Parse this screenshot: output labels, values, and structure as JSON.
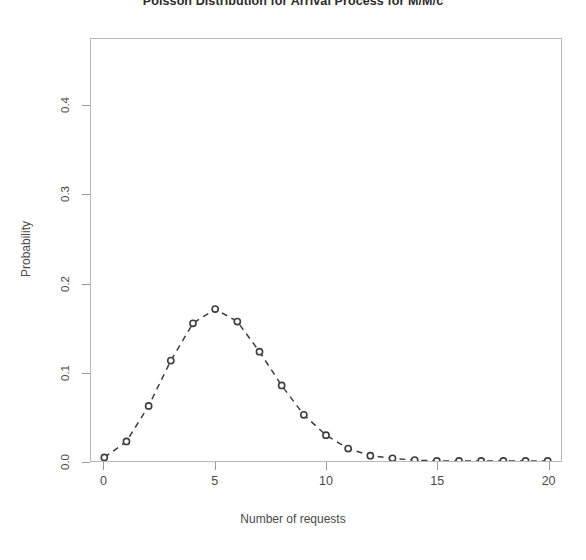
{
  "chart_data": {
    "type": "line",
    "title": "Poisson Distribution for Arrival Process for M/M/c",
    "subtitle": "",
    "xlabel": "Number of requests",
    "ylabel": "Probability",
    "xlim": [
      -0.6,
      20.6
    ],
    "ylim": [
      0.0,
      0.475
    ],
    "grid": false,
    "legend": false,
    "marker": "open-circle",
    "linestyle": "dashed",
    "color": "#3c3c3c",
    "xticks": [
      0,
      5,
      10,
      15,
      20
    ],
    "xtick_labels": [
      "0",
      "5",
      "10",
      "15",
      "20"
    ],
    "yticks": [
      0.0,
      0.1,
      0.2,
      0.3,
      0.4
    ],
    "ytick_labels": [
      "0.0",
      "0.1",
      "0.2",
      "0.3",
      "0.4"
    ],
    "x": [
      0,
      1,
      2,
      3,
      4,
      5,
      6,
      7,
      8,
      9,
      10,
      11,
      12,
      13,
      14,
      15,
      16,
      17,
      18,
      19,
      20
    ],
    "values": [
      0.004,
      0.022,
      0.062,
      0.113,
      0.155,
      0.171,
      0.157,
      0.123,
      0.085,
      0.052,
      0.029,
      0.014,
      0.006,
      0.003,
      0.001,
      0.0,
      0.0,
      0.0,
      0.0,
      0.0,
      0.0
    ],
    "series": [
      {
        "name": "Poisson pmf",
        "values": [
          0.004,
          0.022,
          0.062,
          0.113,
          0.155,
          0.171,
          0.157,
          0.123,
          0.085,
          0.052,
          0.029,
          0.014,
          0.006,
          0.003,
          0.001,
          0.0,
          0.0,
          0.0,
          0.0,
          0.0,
          0.0
        ]
      }
    ]
  }
}
